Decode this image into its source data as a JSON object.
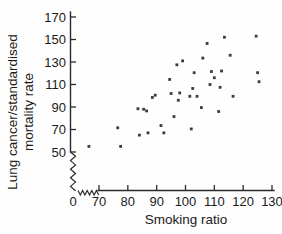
{
  "figure": {
    "background_color": "#ffffff",
    "point_color": "#3b3b44",
    "axis_color": "#2b2b2b"
  },
  "chart_data": {
    "type": "scatter",
    "title": "",
    "xlabel": "Smoking ratio",
    "ylabel": "Lung cancer/standardised mortality rate",
    "ylabel_line1": "Lung cancer/standardised",
    "ylabel_line2": "mortality rate",
    "xlim": [
      66,
      133
    ],
    "ylim": [
      44,
      174
    ],
    "xticks": [
      0,
      70,
      80,
      90,
      100,
      110,
      120,
      130
    ],
    "yticks": [
      50,
      70,
      90,
      110,
      130,
      150,
      170
    ],
    "xtick_labels": [
      "0",
      "70",
      "80",
      "90",
      "100",
      "110",
      "120",
      "130"
    ],
    "ytick_labels": [
      "50",
      "70",
      "90",
      "110",
      "130",
      "150",
      "170"
    ],
    "axis_break_x": true,
    "axis_break_y": true,
    "grid": false,
    "legend": false,
    "n_points": 39,
    "points": [
      {
        "x": 66.5,
        "y": 55.0
      },
      {
        "x": 76.5,
        "y": 71.5
      },
      {
        "x": 77.5,
        "y": 55.0
      },
      {
        "x": 83.5,
        "y": 88.5
      },
      {
        "x": 84.0,
        "y": 65.0
      },
      {
        "x": 85.5,
        "y": 88.0
      },
      {
        "x": 86.5,
        "y": 86.5
      },
      {
        "x": 87.0,
        "y": 67.0
      },
      {
        "x": 88.5,
        "y": 98.5
      },
      {
        "x": 91.5,
        "y": 73.5
      },
      {
        "x": 92.5,
        "y": 67.0
      },
      {
        "x": 94.5,
        "y": 114.5
      },
      {
        "x": 95.0,
        "y": 102.0
      },
      {
        "x": 96.0,
        "y": 81.5
      },
      {
        "x": 97.0,
        "y": 127.5
      },
      {
        "x": 97.5,
        "y": 96.0
      },
      {
        "x": 98.0,
        "y": 102.5
      },
      {
        "x": 101.5,
        "y": 99.5
      },
      {
        "x": 102.0,
        "y": 70.5
      },
      {
        "x": 102.5,
        "y": 106.5
      },
      {
        "x": 103.0,
        "y": 120.5
      },
      {
        "x": 104.0,
        "y": 99.5
      },
      {
        "x": 105.5,
        "y": 89.5
      },
      {
        "x": 106.0,
        "y": 133.5
      },
      {
        "x": 107.5,
        "y": 146.5
      },
      {
        "x": 109.0,
        "y": 121.5
      },
      {
        "x": 110.0,
        "y": 116.0
      },
      {
        "x": 111.5,
        "y": 86.0
      },
      {
        "x": 112.0,
        "y": 107.5
      },
      {
        "x": 112.5,
        "y": 122.0
      },
      {
        "x": 113.5,
        "y": 152.0
      },
      {
        "x": 115.5,
        "y": 136.0
      },
      {
        "x": 116.5,
        "y": 99.5
      },
      {
        "x": 124.5,
        "y": 153.0
      },
      {
        "x": 125.0,
        "y": 120.5
      },
      {
        "x": 125.5,
        "y": 112.5
      },
      {
        "x": 99.0,
        "y": 131.0
      },
      {
        "x": 89.5,
        "y": 100.5
      },
      {
        "x": 108.5,
        "y": 110.0
      }
    ]
  }
}
